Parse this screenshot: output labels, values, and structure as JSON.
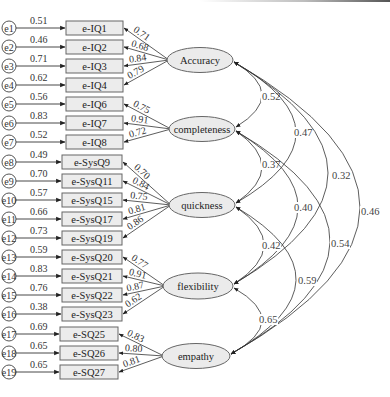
{
  "diagram": {
    "type": "structural-equation-model",
    "colors": {
      "line": "#333333",
      "box_fill": "#ececec",
      "ellipse_fill": "#ebebeb",
      "stroke": "#666666"
    },
    "indicators": [
      {
        "error": "e1",
        "label": "e-IQ1",
        "error_path": "0.51",
        "loading": "0.71",
        "factor": "accuracy"
      },
      {
        "error": "e2",
        "label": "e-IQ2",
        "error_path": "0.46",
        "loading": "0.68",
        "factor": "accuracy"
      },
      {
        "error": "e3",
        "label": "e-IQ3",
        "error_path": "0.71",
        "loading": "0.84",
        "factor": "accuracy"
      },
      {
        "error": "e4",
        "label": "e-IQ4",
        "error_path": "0.62",
        "loading": "0.79",
        "factor": "accuracy"
      },
      {
        "error": "e5",
        "label": "e-IQ6",
        "error_path": "0.56",
        "loading": "0.75",
        "factor": "completeness"
      },
      {
        "error": "e6",
        "label": "e-IQ7",
        "error_path": "0.83",
        "loading": "0.91",
        "factor": "completeness"
      },
      {
        "error": "e7",
        "label": "e-IQ8",
        "error_path": "0.52",
        "loading": "0.72",
        "factor": "completeness"
      },
      {
        "error": "e8",
        "label": "e-SysQ9",
        "error_path": "0.49",
        "loading": "0.70",
        "factor": "quickness"
      },
      {
        "error": "e9",
        "label": "e-SysQ11",
        "error_path": "0.70",
        "loading": "0.84",
        "factor": "quickness"
      },
      {
        "error": "e10",
        "label": "e-SysQ15",
        "error_path": "0.57",
        "loading": "0.75",
        "factor": "quickness"
      },
      {
        "error": "e11",
        "label": "e-SysQ17",
        "error_path": "0.66",
        "loading": "0.81",
        "factor": "quickness"
      },
      {
        "error": "e12",
        "label": "e-SysQ19",
        "error_path": "0.73",
        "loading": "0.86",
        "factor": "quickness"
      },
      {
        "error": "e13",
        "label": "e-SysQ20",
        "error_path": "0.59",
        "loading": "0.77",
        "factor": "flexibility"
      },
      {
        "error": "e14",
        "label": "e-SysQ21",
        "error_path": "0.83",
        "loading": "0.91",
        "factor": "flexibility"
      },
      {
        "error": "e15",
        "label": "e-SysQ22",
        "error_path": "0.76",
        "loading": "0.87",
        "factor": "flexibility"
      },
      {
        "error": "e16",
        "label": "e-SysQ23",
        "error_path": "0.38",
        "loading": "0.62",
        "factor": "flexibility"
      },
      {
        "error": "e17",
        "label": "e-SQ25",
        "error_path": "0.69",
        "loading": "0.83",
        "factor": "empathy"
      },
      {
        "error": "e18",
        "label": "e-SQ26",
        "error_path": "0.65",
        "loading": "0.80",
        "factor": "empathy"
      },
      {
        "error": "e19",
        "label": "e-SQ27",
        "error_path": "0.65",
        "loading": "0.81",
        "factor": "empathy"
      }
    ],
    "factors": [
      {
        "id": "accuracy",
        "label": "Accuracy"
      },
      {
        "id": "completeness",
        "label": "completeness"
      },
      {
        "id": "quickness",
        "label": "quickness"
      },
      {
        "id": "flexibility",
        "label": "flexibility"
      },
      {
        "id": "empathy",
        "label": "empathy"
      }
    ],
    "correlations": [
      {
        "from": "accuracy",
        "to": "completeness",
        "value": "0.52"
      },
      {
        "from": "completeness",
        "to": "quickness",
        "value": "0.37"
      },
      {
        "from": "accuracy",
        "to": "quickness",
        "value": "0.47"
      },
      {
        "from": "accuracy",
        "to": "flexibility",
        "value": "0.32"
      },
      {
        "from": "accuracy",
        "to": "empathy",
        "value": "0.46"
      },
      {
        "from": "completeness",
        "to": "flexibility",
        "value": "0.40"
      },
      {
        "from": "completeness",
        "to": "empathy",
        "value": "0.54"
      },
      {
        "from": "quickness",
        "to": "flexibility",
        "value": "0.42"
      },
      {
        "from": "quickness",
        "to": "empathy",
        "value": "0.59"
      },
      {
        "from": "flexibility",
        "to": "empathy",
        "value": "0.65"
      }
    ]
  }
}
